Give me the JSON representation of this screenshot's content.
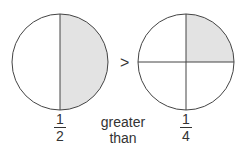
{
  "left": {
    "numerator": "1",
    "denominator": "2",
    "shaded": "right half"
  },
  "right": {
    "numerator": "1",
    "denominator": "4",
    "shaded": "top-right quarter"
  },
  "operator": ">",
  "caption": {
    "line1": "greater",
    "line2": "than"
  },
  "colors": {
    "shade": "#e3e3e3",
    "stroke": "#444444"
  }
}
